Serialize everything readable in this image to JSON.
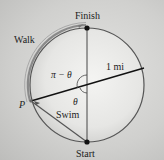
{
  "diagram": {
    "labels": {
      "finish": "Finish",
      "start": "Start",
      "walk": "Walk",
      "swim": "Swim",
      "point": "P",
      "radius": "1 mi",
      "angle_upper": "π − θ",
      "angle_lower": "θ"
    },
    "geometry": {
      "center": [
        87,
        85
      ],
      "radius_px": 57,
      "radius_value": "1 mi"
    },
    "colors": {
      "lake_fill": "#ececea",
      "outline": "#555555",
      "walk_arc": "#8a8a8a",
      "line": "#222222",
      "dot": "#111111"
    }
  }
}
